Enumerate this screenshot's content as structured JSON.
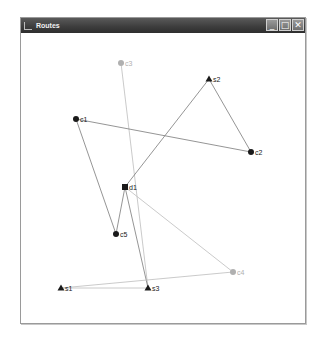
{
  "window": {
    "title": "Routes",
    "controls": {
      "minimize": "_",
      "maximize": "□",
      "close": "✕"
    }
  },
  "colors": {
    "node_dark": "#1a1a1a",
    "node_light": "#b0b0b0",
    "edge_dark": "#7a7a7a",
    "edge_light": "#bdbdbd"
  },
  "graph": {
    "nodes": [
      {
        "id": "c3",
        "label": "c3",
        "shape": "circle",
        "x": 121,
        "y": 63,
        "tone": "light"
      },
      {
        "id": "s2",
        "label": "s2",
        "shape": "triangle",
        "x": 209,
        "y": 79,
        "tone": "dark"
      },
      {
        "id": "c1",
        "label": "c1",
        "shape": "circle",
        "x": 76,
        "y": 119,
        "tone": "dark"
      },
      {
        "id": "c2",
        "label": "c2",
        "shape": "circle",
        "x": 251,
        "y": 152,
        "tone": "dark"
      },
      {
        "id": "d1",
        "label": "d1",
        "shape": "square",
        "x": 125,
        "y": 187,
        "tone": "dark"
      },
      {
        "id": "c5",
        "label": "c5",
        "shape": "circle",
        "x": 116,
        "y": 234,
        "tone": "dark"
      },
      {
        "id": "c4",
        "label": "c4",
        "shape": "circle",
        "x": 233,
        "y": 272,
        "tone": "light"
      },
      {
        "id": "s1",
        "label": "s1",
        "shape": "triangle",
        "x": 61,
        "y": 288,
        "tone": "dark"
      },
      {
        "id": "s3",
        "label": "s3",
        "shape": "triangle",
        "x": 148,
        "y": 288,
        "tone": "dark"
      }
    ],
    "edges": [
      {
        "from": "c3",
        "to": "s3",
        "tone": "light"
      },
      {
        "from": "s2",
        "to": "d1",
        "tone": "dark"
      },
      {
        "from": "s2",
        "to": "c2",
        "tone": "dark"
      },
      {
        "from": "c1",
        "to": "c2",
        "tone": "dark"
      },
      {
        "from": "c1",
        "to": "c5",
        "tone": "dark"
      },
      {
        "from": "c5",
        "to": "d1",
        "tone": "dark"
      },
      {
        "from": "d1",
        "to": "s3",
        "tone": "dark"
      },
      {
        "from": "d1",
        "to": "c4",
        "tone": "light"
      },
      {
        "from": "c4",
        "to": "s1",
        "tone": "light"
      },
      {
        "from": "s1",
        "to": "s3",
        "tone": "light"
      }
    ]
  }
}
